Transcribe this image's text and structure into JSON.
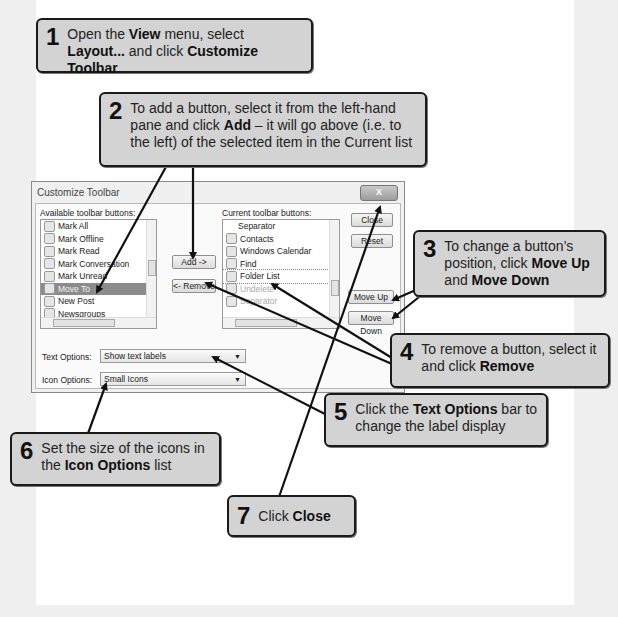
{
  "dialog": {
    "title": "Customize Toolbar",
    "close_x": "X",
    "available_label": "Available toolbar buttons:",
    "current_label": "Current toolbar buttons:",
    "available_items": [
      {
        "label": "Mark All",
        "state": "normal"
      },
      {
        "label": "Mark Offline",
        "state": "normal"
      },
      {
        "label": "Mark Read",
        "state": "normal"
      },
      {
        "label": "Mark Conversation",
        "state": "normal"
      },
      {
        "label": "Mark Unread",
        "state": "normal"
      },
      {
        "label": "Move To",
        "state": "selected"
      },
      {
        "label": "New Post",
        "state": "normal"
      },
      {
        "label": "Newsgroups",
        "state": "normal"
      }
    ],
    "current_items": [
      {
        "label": "Separator",
        "state": "separator"
      },
      {
        "label": "Contacts",
        "state": "normal"
      },
      {
        "label": "Windows Calendar",
        "state": "normal"
      },
      {
        "label": "Find",
        "state": "normal"
      },
      {
        "label": "Folder List",
        "state": "focused"
      },
      {
        "label": "Undelete",
        "state": "disabled"
      },
      {
        "label": "Separator",
        "state": "disabled"
      }
    ],
    "add_button": "Add ->",
    "remove_button": "<- Remove",
    "close_button": "Close",
    "reset_button": "Reset",
    "move_up_button": "Move Up",
    "move_down_button": "Move Down",
    "text_options_label": "Text Options:",
    "text_options_value": "Show text labels",
    "icon_options_label": "Icon Options:",
    "icon_options_value": "Small Icons",
    "scroll_glyph": "|||",
    "dropdown_glyph": "▼"
  },
  "callouts": [
    {
      "num": "1",
      "parts": [
        "Open the ",
        {
          "b": "View"
        },
        " menu, select ",
        {
          "b": "Layout..."
        },
        " and click ",
        {
          "b": "Customize Toolbar"
        }
      ]
    },
    {
      "num": "2",
      "parts": [
        "To add a button, select it from the left-hand pane and click ",
        {
          "b": "Add"
        },
        " – it will go above (i.e. to the left) of the selected item in the Current list"
      ]
    },
    {
      "num": "3",
      "parts": [
        "To change a button’s position, click ",
        {
          "b": "Move Up"
        },
        " and ",
        {
          "b": "Move Down"
        }
      ]
    },
    {
      "num": "4",
      "parts": [
        "To remove a button, select it and click ",
        {
          "b": "Remove"
        }
      ]
    },
    {
      "num": "5",
      "parts": [
        "Click the ",
        {
          "b": "Text Options"
        },
        " bar to change the label display"
      ]
    },
    {
      "num": "6",
      "parts": [
        "Set the size of the icons in the ",
        {
          "b": "Icon Options"
        },
        " list"
      ]
    },
    {
      "num": "7",
      "parts": [
        "Click ",
        {
          "b": "Close"
        }
      ]
    }
  ],
  "colors": {
    "callout_fill": "#d3d3d3",
    "callout_border": "#1a1a1a",
    "page_bg": "#efefef",
    "panel_bg": "#ffffff",
    "selected_item": "#8c8c8c"
  }
}
